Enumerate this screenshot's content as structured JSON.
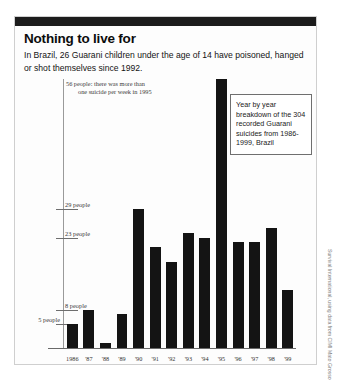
{
  "header": {
    "title": "Nothing to live for",
    "subtitle": "In Brazil, 26 Guarani children under the age of 14 have poisoned, hanged or shot themselves since 1992."
  },
  "annotations": {
    "peak_note_line1": "56 people: there was more than",
    "peak_note_line2": "one suicide per week in 1995",
    "callout": "Year by year breakdown of the 304 recorded Guarani suicides from 1986-1999, Brazil"
  },
  "credit": "Survival International, using data from CIMI Mato Grosso do Sul",
  "chart_data": {
    "type": "bar",
    "title": "Nothing to live for",
    "subtitle": "In Brazil, 26 Guarani children under the age of 14 have poisoned, hanged or shot themselves since 1992.",
    "xlabel": "",
    "ylabel": "people",
    "ylim": [
      0,
      56
    ],
    "grid": false,
    "legend": "none",
    "total_recorded": 304,
    "categories": [
      "1986",
      "'87",
      "'88",
      "'89",
      "'90",
      "'91",
      "'92",
      "'93",
      "'94",
      "'95",
      "'96",
      "'97",
      "'98",
      "'99"
    ],
    "values": [
      5,
      8,
      1,
      7,
      29,
      21,
      18,
      24,
      23,
      56,
      22,
      22,
      25,
      12
    ],
    "ytick_values": [
      29,
      23,
      8,
      5
    ],
    "ytick_labels": [
      "29 people",
      "23 people",
      "8 people",
      "5 people"
    ],
    "ytick_label_side": [
      "right",
      "right",
      "right",
      "left"
    ],
    "annotations": [
      {
        "value": 56,
        "category": "'95",
        "text": "56 people: there was more than one suicide per week in 1995"
      }
    ]
  }
}
